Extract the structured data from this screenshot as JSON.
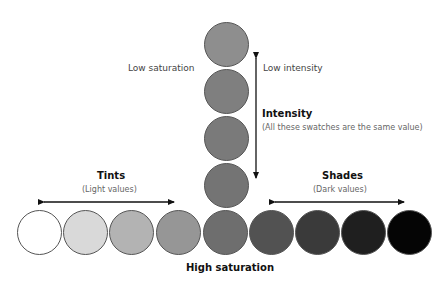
{
  "labels": {
    "low_saturation": "Low saturation",
    "low_intensity": "Low intensity",
    "intensity_title": "Intensity",
    "intensity_sub": "(All these swatches are the same value)",
    "tints_title": "Tints",
    "tints_sub": "(Light values)",
    "shades_title": "Shades",
    "shades_sub": "(Dark values)",
    "high_saturation": "High saturation"
  },
  "vertical_swatches": [
    {
      "color": "#8e8e8e"
    },
    {
      "color": "#7f7f7f"
    },
    {
      "color": "#7a7a7a"
    },
    {
      "color": "#747474"
    }
  ],
  "row_swatches": [
    {
      "color": "#ffffff"
    },
    {
      "color": "#d9d9d9"
    },
    {
      "color": "#b3b3b3"
    },
    {
      "color": "#969696"
    },
    {
      "color": "#6e6e6e"
    },
    {
      "color": "#525252"
    },
    {
      "color": "#3a3a3a"
    },
    {
      "color": "#1f1f1f"
    },
    {
      "color": "#050505"
    }
  ]
}
